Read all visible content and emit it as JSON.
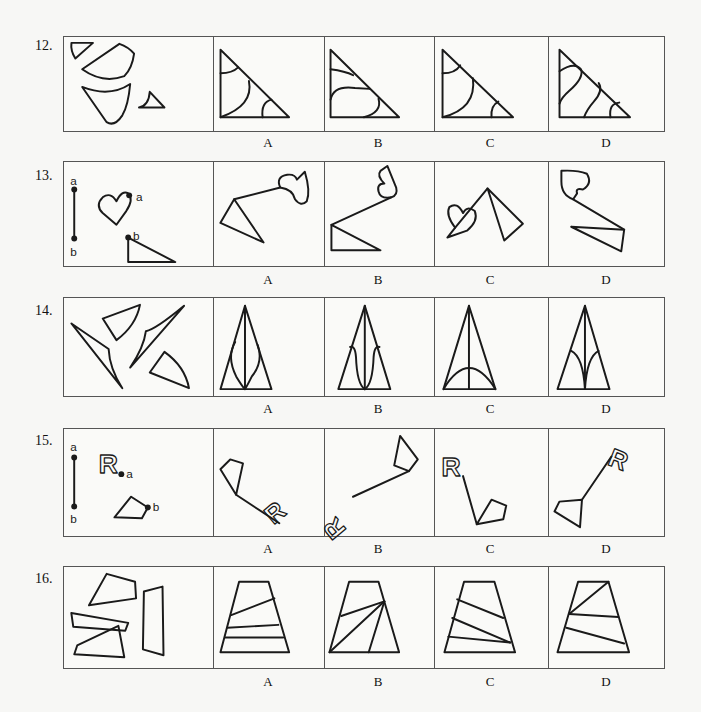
{
  "questions": [
    {
      "number": "12.",
      "options": [
        "A",
        "B",
        "C",
        "D"
      ]
    },
    {
      "number": "13.",
      "options": [
        "A",
        "B",
        "C",
        "D"
      ],
      "point_labels": [
        "a",
        "b",
        "a",
        "b"
      ]
    },
    {
      "number": "14.",
      "options": [
        "A",
        "B",
        "C",
        "D"
      ]
    },
    {
      "number": "15.",
      "options": [
        "A",
        "B",
        "C",
        "D"
      ],
      "point_labels": [
        "a",
        "b",
        "a",
        "b"
      ],
      "letter_shape": "R"
    },
    {
      "number": "16.",
      "options": [
        "A",
        "B",
        "C",
        "D"
      ]
    }
  ]
}
